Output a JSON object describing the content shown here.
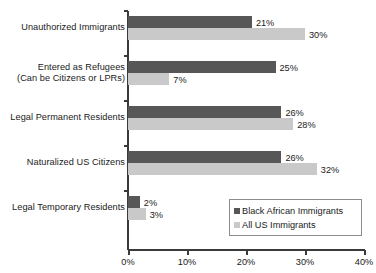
{
  "chart_data": {
    "type": "bar",
    "orientation": "horizontal",
    "title": "",
    "xlabel": "",
    "ylabel": "",
    "xlim": [
      0,
      40
    ],
    "xticks": [
      "0%",
      "10%",
      "20%",
      "30%",
      "40%"
    ],
    "xtick_values": [
      0,
      10,
      20,
      30,
      40
    ],
    "grid": false,
    "legend_position": "bottom-right",
    "categories": [
      "Unauthorized Immigrants",
      "Entered as Refugees\n(Can be Citizens or LPRs)",
      "Legal Permanent Residents",
      "Naturalized US Citizens",
      "Legal Temporary Residents"
    ],
    "category_lines": [
      [
        "Unauthorized Immigrants"
      ],
      [
        "Entered as Refugees",
        "(Can be Citizens or LPRs)"
      ],
      [
        "Legal Permanent Residents"
      ],
      [
        "Naturalized US Citizens"
      ],
      [
        "Legal Temporary Residents"
      ]
    ],
    "series": [
      {
        "name": "Black African Immigrants",
        "color": "#575757",
        "values": [
          21,
          25,
          26,
          26,
          2
        ],
        "labels": [
          "21%",
          "25%",
          "26%",
          "26%",
          "2%"
        ]
      },
      {
        "name": "All US Immigrants",
        "color": "#c9c9c9",
        "values": [
          30,
          7,
          28,
          32,
          3
        ],
        "labels": [
          "30%",
          "7%",
          "28%",
          "32%",
          "3%"
        ]
      }
    ]
  },
  "legend": {
    "items": [
      {
        "label": "Black African Immigrants",
        "color": "#575757"
      },
      {
        "label": "All US Immigrants",
        "color": "#c9c9c9"
      }
    ]
  },
  "axis": {
    "tick_labels": [
      "0%",
      "10%",
      "20%",
      "30%",
      "40%"
    ]
  }
}
